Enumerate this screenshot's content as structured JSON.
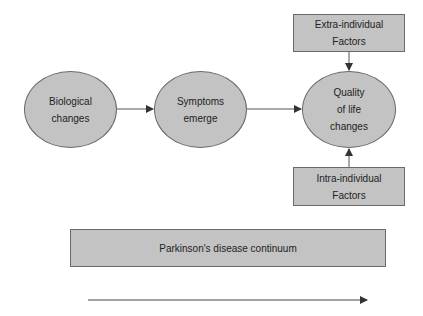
{
  "diagram": {
    "nodes": [
      {
        "id": "bio",
        "shape": "ellipse",
        "lines": [
          "Biological",
          "changes"
        ]
      },
      {
        "id": "sym",
        "shape": "ellipse",
        "lines": [
          "Symptoms",
          "emerge"
        ]
      },
      {
        "id": "qol",
        "shape": "ellipse",
        "lines": [
          "Quality",
          "of life",
          "changes"
        ]
      },
      {
        "id": "extra",
        "shape": "rect",
        "lines": [
          "Extra-individual",
          "Factors"
        ]
      },
      {
        "id": "intra",
        "shape": "rect",
        "lines": [
          "Intra-individual",
          "Factors"
        ]
      },
      {
        "id": "continuum",
        "shape": "rect",
        "lines": [
          "Parkinson's disease continuum"
        ]
      }
    ],
    "edges": [
      {
        "from": "bio",
        "to": "sym"
      },
      {
        "from": "sym",
        "to": "qol"
      },
      {
        "from": "extra",
        "to": "qol"
      },
      {
        "from": "intra",
        "to": "qol"
      }
    ],
    "timeline_arrow": {
      "direction": "right"
    },
    "colors": {
      "fill": "#c3c3c3",
      "stroke": "#6a6a6a",
      "text": "#222222",
      "arrow": "#333333"
    }
  }
}
